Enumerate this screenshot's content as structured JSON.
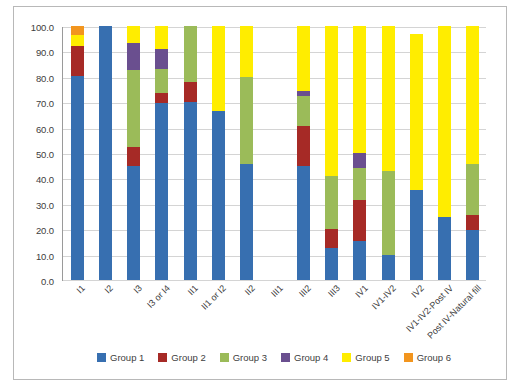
{
  "chart_data": {
    "type": "bar",
    "stacked": true,
    "title": "",
    "xlabel": "",
    "ylabel": "",
    "ylim": [
      0,
      100
    ],
    "yticks": [
      "0.0",
      "10.0",
      "20.0",
      "30.0",
      "40.0",
      "50.0",
      "60.0",
      "70.0",
      "80.0",
      "90.0",
      "100.0"
    ],
    "grid": true,
    "legend_position": "bottom",
    "categories": [
      "I1",
      "I2",
      "I3",
      "I3 or I4",
      "II1",
      "II1 or I2",
      "II2",
      "III1",
      "III2",
      "III3",
      "IV1",
      "IV1-IV2",
      "IV2",
      "IV1-IV2-Post IV",
      "Post IV-Natural fill"
    ],
    "series": [
      {
        "name": "Group 1",
        "color": "#376fb0",
        "values": [
          80.5,
          100.0,
          45.0,
          69.5,
          70.0,
          66.5,
          45.5,
          0,
          45.0,
          12.5,
          15.5,
          10.0,
          35.5,
          25.0,
          19.5
        ]
      },
      {
        "name": "Group 2",
        "color": "#a62a26",
        "values": [
          11.5,
          0.0,
          7.5,
          4.0,
          8.0,
          0.0,
          0.0,
          0,
          15.5,
          7.5,
          16.0,
          0.0,
          0.0,
          0.0,
          6.0
        ]
      },
      {
        "name": "Group 3",
        "color": "#9bbb59",
        "values": [
          0.0,
          0.0,
          30.0,
          9.5,
          22.0,
          0.0,
          34.5,
          0,
          12.0,
          21.0,
          12.5,
          33.0,
          0.0,
          0.0,
          20.0
        ]
      },
      {
        "name": "Group 4",
        "color": "#6a4f8f",
        "values": [
          0.0,
          0.0,
          11.0,
          8.0,
          0.0,
          0.0,
          0.0,
          0,
          2.0,
          0.0,
          6.0,
          0.0,
          0.0,
          0.0,
          0.0
        ]
      },
      {
        "name": "Group 5",
        "color": "#ffed00",
        "values": [
          4.5,
          0.0,
          6.5,
          9.0,
          0.0,
          33.5,
          20.0,
          0,
          25.5,
          59.0,
          50.0,
          57.0,
          61.5,
          75.0,
          54.5
        ]
      },
      {
        "name": "Group 6",
        "color": "#f2951e",
        "values": [
          3.5,
          0.0,
          0.0,
          0.0,
          0.0,
          0.0,
          0.0,
          0,
          0.0,
          0.0,
          0.0,
          0.0,
          0.0,
          0.0,
          0.0
        ]
      }
    ]
  }
}
